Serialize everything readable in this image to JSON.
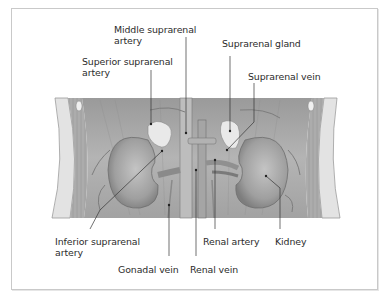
{
  "diagram": {
    "labels": {
      "middle_suprarenal_artery": [
        "Middle suprarenal",
        "artery"
      ],
      "superior_suprarenal_artery": [
        "Superior suprarenal",
        "artery"
      ],
      "suprarenal_gland": "Suprarenal gland",
      "suprarenal_vein": "Suprarenal vein",
      "inferior_suprarenal_artery": [
        "Inferior suprarenal",
        "artery"
      ],
      "renal_artery": "Renal artery",
      "kidney": "Kidney",
      "gonadal_vein": "Gonadal vein",
      "renal_vein": "Renal vein"
    },
    "colors": {
      "frame_border": "#c9c9c9",
      "leader_line": "#333333",
      "text": "#2b2b2b",
      "tissue": "#a9a9a9"
    }
  }
}
